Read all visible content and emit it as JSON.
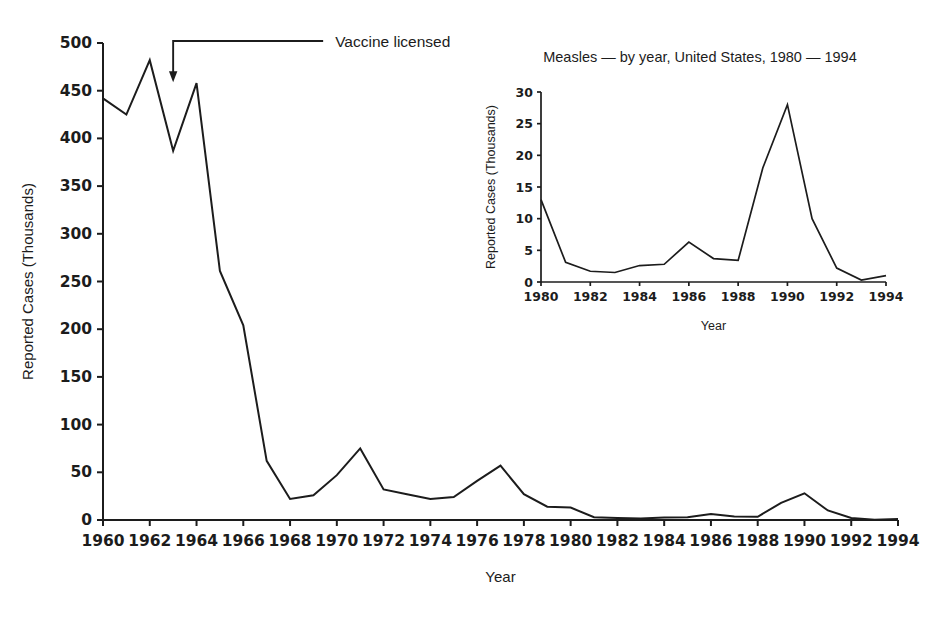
{
  "figure": {
    "background": "#ffffff",
    "ink": "#1c1c1c"
  },
  "chart_data": [
    {
      "id": "main",
      "type": "line",
      "title": "",
      "xlabel": "Year",
      "ylabel": "Reported Cases (Thousands)",
      "xlim": [
        1960,
        1994
      ],
      "ylim": [
        0,
        500
      ],
      "grid": false,
      "legend": "none",
      "ytick_labels": [
        "0",
        "50",
        "100",
        "150",
        "200",
        "250",
        "300",
        "350",
        "400",
        "450",
        "500"
      ],
      "ytick_values": [
        0,
        50,
        100,
        150,
        200,
        250,
        300,
        350,
        400,
        450,
        500
      ],
      "xtick_labels": [
        "1960",
        "1962",
        "1964",
        "1966",
        "1968",
        "1970",
        "1972",
        "1974",
        "1976",
        "1978",
        "1980",
        "1982",
        "1984",
        "1986",
        "1988",
        "1990",
        "1992",
        "1994"
      ],
      "xtick_values": [
        1960,
        1962,
        1964,
        1966,
        1968,
        1970,
        1972,
        1974,
        1976,
        1978,
        1980,
        1982,
        1984,
        1986,
        1988,
        1990,
        1992,
        1994
      ],
      "x": [
        1960,
        1961,
        1962,
        1963,
        1964,
        1965,
        1966,
        1967,
        1968,
        1969,
        1970,
        1971,
        1972,
        1973,
        1974,
        1975,
        1976,
        1977,
        1978,
        1979,
        1980,
        1981,
        1982,
        1983,
        1984,
        1985,
        1986,
        1987,
        1988,
        1989,
        1990,
        1991,
        1992,
        1993,
        1994
      ],
      "values": [
        442,
        425,
        482,
        387,
        458,
        261,
        204,
        62,
        22,
        26,
        47,
        75,
        32,
        27,
        22,
        24,
        41,
        57,
        27,
        14,
        13,
        3,
        2,
        1.5,
        2.6,
        2.8,
        6.3,
        3.7,
        3.4,
        18,
        28,
        10,
        2.2,
        0.3,
        1
      ],
      "annotations": [
        {
          "text": "Vaccine licensed",
          "points_to_year": 1963,
          "points_to_value": 460
        }
      ]
    },
    {
      "id": "inset",
      "type": "line",
      "title": "Measles — by year, United States, 1980 — 1994",
      "xlabel": "Year",
      "ylabel": "Reported Cases (Thousands)",
      "xlim": [
        1980,
        1994
      ],
      "ylim": [
        0,
        30
      ],
      "grid": false,
      "legend": "none",
      "ytick_labels": [
        "0",
        "5",
        "10",
        "15",
        "20",
        "25",
        "30"
      ],
      "ytick_values": [
        0,
        5,
        10,
        15,
        20,
        25,
        30
      ],
      "xtick_labels": [
        "1980",
        "1982",
        "1984",
        "1986",
        "1988",
        "1990",
        "1992",
        "1994"
      ],
      "xtick_values": [
        1980,
        1982,
        1984,
        1986,
        1988,
        1990,
        1992,
        1994
      ],
      "x": [
        1980,
        1981,
        1982,
        1983,
        1984,
        1985,
        1986,
        1987,
        1988,
        1989,
        1990,
        1991,
        1992,
        1993,
        1994
      ],
      "values": [
        13,
        3.1,
        1.7,
        1.5,
        2.6,
        2.8,
        6.3,
        3.7,
        3.4,
        18,
        28,
        10,
        2.2,
        0.3,
        1
      ]
    }
  ]
}
